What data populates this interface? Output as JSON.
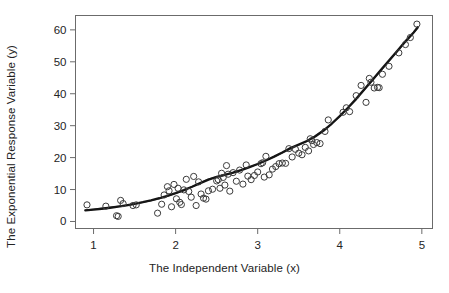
{
  "chart_data": {
    "type": "scatter",
    "title": "",
    "xlabel": "The Independent Variable (x)",
    "ylabel": "The Exponential Response Variable (y)",
    "xlim": [
      0.78,
      5.13
    ],
    "ylim": [
      -2.2,
      64.5
    ],
    "xticks": [
      1,
      2,
      3,
      4,
      5
    ],
    "yticks": [
      0,
      10,
      20,
      30,
      40,
      50,
      60
    ],
    "grid": false,
    "legend": null,
    "box": "full-rectangle",
    "marker": {
      "shape": "open-circle",
      "radius_px": 3.1,
      "stroke": "#3b3b3b",
      "fill": "none",
      "stroke_width": 1.0
    },
    "series": [
      {
        "name": "observations",
        "type": "scatter",
        "points": [
          [
            0.92,
            5.2
          ],
          [
            1.15,
            4.8
          ],
          [
            1.28,
            1.8
          ],
          [
            1.3,
            1.6
          ],
          [
            1.33,
            6.6
          ],
          [
            1.36,
            5.6
          ],
          [
            1.48,
            5.0
          ],
          [
            1.52,
            5.2
          ],
          [
            1.78,
            2.6
          ],
          [
            1.83,
            5.4
          ],
          [
            1.86,
            8.3
          ],
          [
            1.9,
            10.9
          ],
          [
            1.92,
            9.6
          ],
          [
            1.95,
            4.6
          ],
          [
            1.98,
            11.6
          ],
          [
            2.01,
            7.1
          ],
          [
            2.03,
            10.4
          ],
          [
            2.05,
            6.0
          ],
          [
            2.07,
            5.3
          ],
          [
            2.1,
            9.9
          ],
          [
            2.13,
            13.2
          ],
          [
            2.16,
            9.4
          ],
          [
            2.19,
            7.6
          ],
          [
            2.22,
            14.1
          ],
          [
            2.25,
            5.0
          ],
          [
            2.28,
            12.4
          ],
          [
            2.31,
            8.6
          ],
          [
            2.34,
            7.3
          ],
          [
            2.37,
            7.0
          ],
          [
            2.4,
            9.6
          ],
          [
            2.45,
            10.1
          ],
          [
            2.5,
            12.7
          ],
          [
            2.52,
            13.1
          ],
          [
            2.54,
            10.4
          ],
          [
            2.56,
            15.1
          ],
          [
            2.58,
            13.8
          ],
          [
            2.6,
            11.4
          ],
          [
            2.62,
            17.5
          ],
          [
            2.64,
            14.8
          ],
          [
            2.66,
            9.5
          ],
          [
            2.7,
            15.3
          ],
          [
            2.74,
            12.6
          ],
          [
            2.78,
            16.1
          ],
          [
            2.82,
            11.7
          ],
          [
            2.86,
            17.7
          ],
          [
            2.88,
            14.2
          ],
          [
            2.92,
            13.1
          ],
          [
            2.96,
            14.4
          ],
          [
            3.0,
            15.5
          ],
          [
            3.04,
            18.1
          ],
          [
            3.06,
            18.4
          ],
          [
            3.08,
            13.9
          ],
          [
            3.1,
            20.4
          ],
          [
            3.14,
            14.6
          ],
          [
            3.18,
            16.4
          ],
          [
            3.22,
            17.2
          ],
          [
            3.26,
            18.1
          ],
          [
            3.3,
            18.3
          ],
          [
            3.34,
            18.2
          ],
          [
            3.38,
            22.8
          ],
          [
            3.42,
            20.2
          ],
          [
            3.46,
            22.6
          ],
          [
            3.5,
            21.4
          ],
          [
            3.54,
            20.9
          ],
          [
            3.58,
            23.2
          ],
          [
            3.62,
            22.1
          ],
          [
            3.64,
            25.9
          ],
          [
            3.66,
            25.3
          ],
          [
            3.68,
            24.1
          ],
          [
            3.72,
            24.7
          ],
          [
            3.76,
            24.4
          ],
          [
            3.82,
            28.2
          ],
          [
            3.86,
            31.8
          ],
          [
            4.04,
            34.2
          ],
          [
            4.08,
            35.6
          ],
          [
            4.12,
            34.4
          ],
          [
            4.2,
            39.4
          ],
          [
            4.26,
            42.6
          ],
          [
            4.32,
            37.3
          ],
          [
            4.36,
            44.8
          ],
          [
            4.38,
            43.6
          ],
          [
            4.42,
            41.8
          ],
          [
            4.46,
            42.0
          ],
          [
            4.48,
            41.9
          ],
          [
            4.52,
            46.1
          ],
          [
            4.6,
            48.6
          ],
          [
            4.72,
            52.8
          ],
          [
            4.8,
            55.4
          ],
          [
            4.86,
            57.6
          ],
          [
            4.94,
            61.8
          ]
        ]
      },
      {
        "name": "fitted-exponential-curve",
        "type": "line",
        "color": "#151515",
        "width_px": 2.3,
        "description": "Fitted exponential regression curve y ~ a*exp(b*x)",
        "points": [
          [
            0.9,
            3.45
          ],
          [
            1.0,
            3.7
          ],
          [
            1.1,
            3.98
          ],
          [
            1.2,
            4.3
          ],
          [
            1.3,
            4.66
          ],
          [
            1.4,
            5.06
          ],
          [
            1.5,
            5.52
          ],
          [
            1.6,
            6.03
          ],
          [
            1.7,
            6.62
          ],
          [
            1.8,
            7.28
          ],
          [
            1.9,
            8.02
          ],
          [
            2.0,
            8.86
          ],
          [
            2.1,
            9.8
          ],
          [
            2.2,
            10.86
          ],
          [
            2.3,
            12.0
          ],
          [
            2.4,
            13.12
          ],
          [
            2.5,
            13.96
          ],
          [
            2.6,
            14.6
          ],
          [
            2.7,
            15.3
          ],
          [
            2.8,
            16.1
          ],
          [
            2.9,
            17.0
          ],
          [
            3.0,
            18.0
          ],
          [
            3.1,
            19.1
          ],
          [
            3.2,
            20.3
          ],
          [
            3.3,
            21.6
          ],
          [
            3.4,
            23.0
          ],
          [
            3.5,
            24.1
          ],
          [
            3.6,
            25.2
          ],
          [
            3.7,
            26.6
          ],
          [
            3.8,
            28.4
          ],
          [
            3.9,
            30.6
          ],
          [
            4.0,
            33.0
          ],
          [
            4.1,
            35.6
          ],
          [
            4.2,
            38.4
          ],
          [
            4.3,
            41.4
          ],
          [
            4.4,
            44.4
          ],
          [
            4.5,
            47.4
          ],
          [
            4.6,
            50.4
          ],
          [
            4.7,
            53.4
          ],
          [
            4.8,
            56.4
          ],
          [
            4.9,
            59.2
          ],
          [
            4.95,
            60.8
          ]
        ]
      },
      {
        "name": "loess-smooth-curve",
        "type": "line",
        "color": "#5a5a5a",
        "width_px": 1.4,
        "description": "Overlaid smoothing curve nearly coincident with the fitted curve",
        "points": [
          [
            0.9,
            3.55
          ],
          [
            1.2,
            4.42
          ],
          [
            1.5,
            5.42
          ],
          [
            1.8,
            7.1
          ],
          [
            2.1,
            9.65
          ],
          [
            2.4,
            13.25
          ],
          [
            2.7,
            15.25
          ],
          [
            3.0,
            17.95
          ],
          [
            3.3,
            21.45
          ],
          [
            3.6,
            25.05
          ],
          [
            3.9,
            30.45
          ],
          [
            4.2,
            38.2
          ],
          [
            4.5,
            47.2
          ],
          [
            4.8,
            56.2
          ],
          [
            4.95,
            60.6
          ]
        ]
      }
    ]
  },
  "axes": {
    "x_tick_labels": [
      "1",
      "2",
      "3",
      "4",
      "5"
    ],
    "y_tick_labels": [
      "0",
      "10",
      "20",
      "30",
      "40",
      "50",
      "60"
    ]
  },
  "style": {
    "background": "#ffffff",
    "axis_color": "#6b6b6b",
    "text_color": "#242424",
    "marker_color": "#3b3b3b",
    "curve_color": "#151515",
    "smooth_color": "#5a5a5a"
  }
}
